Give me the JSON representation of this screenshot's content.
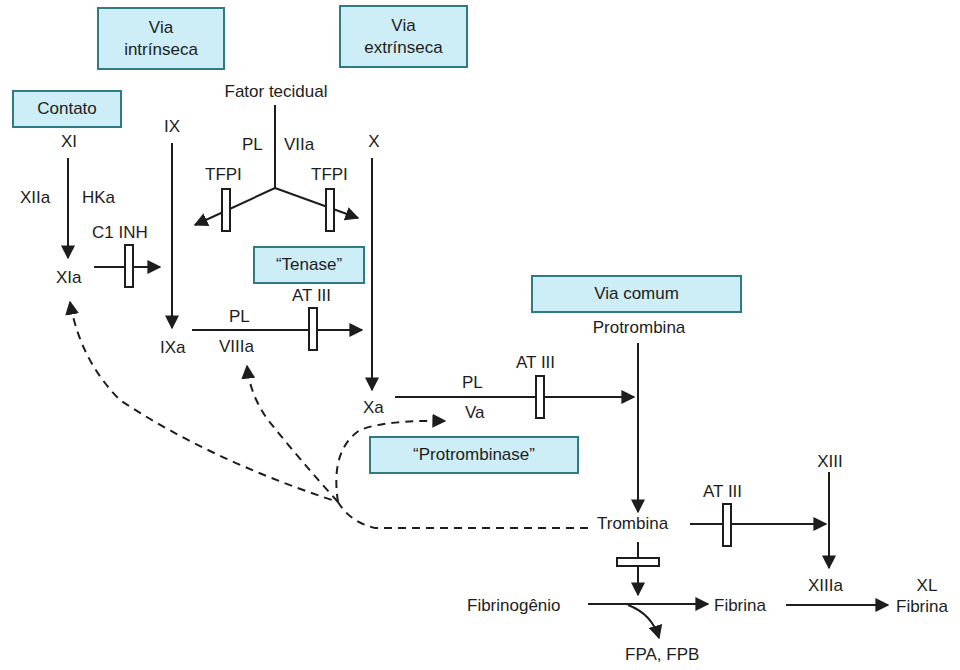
{
  "colors": {
    "box_fill": "#cdeef6",
    "box_border": "#2e7b86",
    "line": "#1d1d1d"
  },
  "boxes": {
    "intrinsic": "Via intrínseca",
    "intrinsic_l1": "Via",
    "intrinsic_l2": "intrínseca",
    "extrinsic_l1": "Via",
    "extrinsic_l2": "extrínseca",
    "contact": "Contato",
    "tenase": "“Tenase”",
    "common": "Via comum",
    "prothrombinase": "“Protrombinase”"
  },
  "labels": {
    "tissue_factor": "Fator tecidual",
    "pl_vii": "PL",
    "viia": "VIIa",
    "tfpi_left": "TFPI",
    "tfpi_right": "TFPI",
    "xi": "XI",
    "xiia": "XIIa",
    "hka": "HKa",
    "c1inh": "C1 INH",
    "xia": "XIa",
    "ix": "IX",
    "ixa": "IXa",
    "pl_tenase": "PL",
    "viiia": "VIIIa",
    "at3_tenase": "AT III",
    "x": "X",
    "xa": "Xa",
    "pl_prothrombinase": "PL",
    "va": "Va",
    "at3_prothrombinase": "AT III",
    "prothrombin": "Protrombina",
    "thrombin": "Trombina",
    "at3_thrombin": "AT III",
    "xiii": "XIII",
    "xiiia": "XIIIa",
    "fibrinogen": "Fibrinogênio",
    "fibrin": "Fibrina",
    "xl": "XL",
    "xl_fibrin": "Fibrina",
    "fpa_fpb": "FPA, FPB"
  }
}
